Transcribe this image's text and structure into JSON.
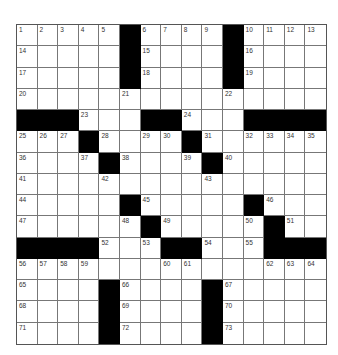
{
  "puzzle": {
    "rows": 15,
    "cols": 15,
    "colors": {
      "black": "#000000",
      "white": "#ffffff",
      "line": "#777777"
    },
    "grid": [
      [
        "1",
        "2",
        "3",
        "4",
        "5",
        "#",
        "6",
        "7",
        "8",
        "9",
        "#",
        "10",
        "11",
        "12",
        "13"
      ],
      [
        "14",
        "",
        "",
        "",
        "",
        "#",
        "15",
        "",
        "",
        "",
        "#",
        "16",
        "",
        "",
        ""
      ],
      [
        "17",
        "",
        "",
        "",
        "",
        "#",
        "18",
        "",
        "",
        "",
        "#",
        "19",
        "",
        "",
        ""
      ],
      [
        "20",
        "",
        "",
        "",
        "",
        "21",
        "",
        "",
        "",
        "",
        "22",
        "",
        "",
        "",
        ""
      ],
      [
        "#",
        "#",
        "#",
        "23",
        "",
        "",
        "#",
        "#",
        "24",
        "",
        "",
        "#",
        "#",
        "#",
        "#"
      ],
      [
        "25",
        "26",
        "27",
        "#",
        "28",
        "",
        "29",
        "30",
        "#",
        "31",
        "",
        "32",
        "33",
        "34",
        "35"
      ],
      [
        "36",
        "",
        "",
        "37",
        "#",
        "38",
        "",
        "",
        "39",
        "#",
        "40",
        "",
        "",
        "",
        ""
      ],
      [
        "41",
        "",
        "",
        "",
        "42",
        "",
        "",
        "",
        "",
        "43",
        "",
        "",
        "",
        "",
        ""
      ],
      [
        "44",
        "",
        "",
        "",
        "",
        "#",
        "45",
        "",
        "",
        "",
        "",
        "#",
        "46",
        "",
        ""
      ],
      [
        "47",
        "",
        "",
        "",
        "",
        "48",
        "#",
        "49",
        "",
        "",
        "",
        "50",
        "#",
        "51",
        ""
      ],
      [
        "#",
        "#",
        "#",
        "#",
        "52",
        "",
        "53",
        "#",
        "#",
        "54",
        "",
        "55",
        "#",
        "#",
        "#"
      ],
      [
        "56",
        "57",
        "58",
        "59",
        "",
        "",
        "",
        "60",
        "61",
        "",
        "",
        "",
        "62",
        "63",
        "64"
      ],
      [
        "65",
        "",
        "",
        "",
        "#",
        "66",
        "",
        "",
        "",
        "#",
        "67",
        "",
        "",
        "",
        ""
      ],
      [
        "68",
        "",
        "",
        "",
        "#",
        "69",
        "",
        "",
        "",
        "#",
        "70",
        "",
        "",
        "",
        ""
      ],
      [
        "71",
        "",
        "",
        "",
        "#",
        "72",
        "",
        "",
        "",
        "#",
        "73",
        "",
        "",
        "",
        ""
      ]
    ]
  }
}
